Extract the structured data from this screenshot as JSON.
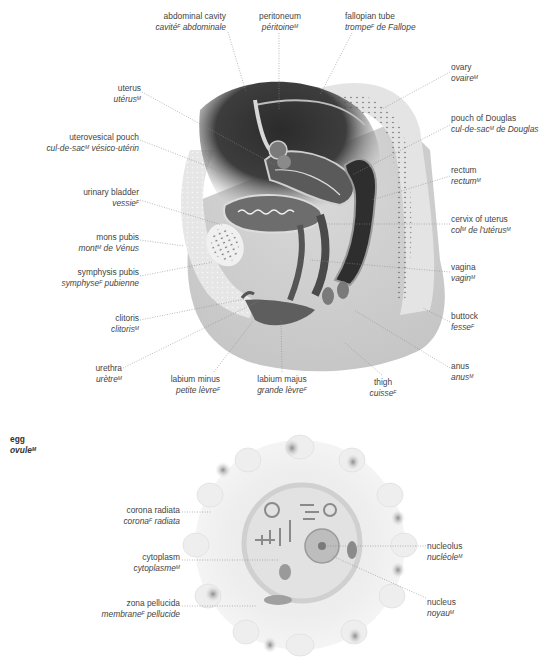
{
  "pelvis": {
    "labels": [
      {
        "id": "abdominal-cavity",
        "en": "abdominal cavity",
        "fr": "cavité",
        "fr_gender": "F",
        "fr_rest": " abdominale",
        "x": 226,
        "y": 11,
        "align": "r"
      },
      {
        "id": "peritoneum",
        "en": "peritoneum",
        "fr": "péritoine",
        "fr_gender": "M",
        "fr_rest": "",
        "x": 281,
        "y": 11,
        "align": "c"
      },
      {
        "id": "fallopian-tube",
        "en": "fallopian tube",
        "fr": "trompe",
        "fr_gender": "F",
        "fr_rest": " de Fallope",
        "x": 345,
        "y": 11,
        "align": "l"
      },
      {
        "id": "ovary",
        "en": "ovary",
        "fr": "ovaire",
        "fr_gender": "M",
        "fr_rest": "",
        "x": 451,
        "y": 62,
        "align": "l"
      },
      {
        "id": "uterus",
        "en": "uterus",
        "fr": "utérus",
        "fr_gender": "M",
        "fr_rest": "",
        "x": 141,
        "y": 83,
        "align": "r"
      },
      {
        "id": "uterovesical-pouch",
        "en": "uterovesical pouch",
        "fr": "cul-de-sac",
        "fr_gender": "M",
        "fr_rest": " vésico-utérin",
        "x": 139,
        "y": 132,
        "align": "r"
      },
      {
        "id": "pouch-of-douglas",
        "en": "pouch of Douglas",
        "fr": "cul-de-sac",
        "fr_gender": "M",
        "fr_rest": " de Douglas",
        "x": 451,
        "y": 113,
        "align": "l"
      },
      {
        "id": "rectum",
        "en": "rectum",
        "fr": "rectum",
        "fr_gender": "M",
        "fr_rest": "",
        "x": 451,
        "y": 165,
        "align": "l"
      },
      {
        "id": "urinary-bladder",
        "en": "urinary bladder",
        "fr": "vessie",
        "fr_gender": "F",
        "fr_rest": "",
        "x": 139,
        "y": 187,
        "align": "r"
      },
      {
        "id": "cervix-of-uterus",
        "en": "cervix of uterus",
        "fr": "col",
        "fr_gender": "M",
        "fr_rest": " de l'utérus",
        "fr_gender2": "M",
        "x": 451,
        "y": 214,
        "align": "l"
      },
      {
        "id": "mons-pubis",
        "en": "mons pubis",
        "fr": "mont",
        "fr_gender": "M",
        "fr_rest": " de Vénus",
        "x": 139,
        "y": 232,
        "align": "r"
      },
      {
        "id": "symphysis-pubis",
        "en": "symphysis pubis",
        "fr": "symphyse",
        "fr_gender": "F",
        "fr_rest": " pubienne",
        "x": 139,
        "y": 267,
        "align": "r"
      },
      {
        "id": "vagina",
        "en": "vagina",
        "fr": "vagin",
        "fr_gender": "M",
        "fr_rest": "",
        "x": 451,
        "y": 262,
        "align": "l"
      },
      {
        "id": "clitoris",
        "en": "clitoris",
        "fr": "clitoris",
        "fr_gender": "M",
        "fr_rest": "",
        "x": 139,
        "y": 313,
        "align": "r"
      },
      {
        "id": "buttock",
        "en": "buttock",
        "fr": "fesse",
        "fr_gender": "F",
        "fr_rest": "",
        "x": 451,
        "y": 311,
        "align": "l"
      },
      {
        "id": "anus",
        "en": "anus",
        "fr": "anus",
        "fr_gender": "M",
        "fr_rest": "",
        "x": 451,
        "y": 361,
        "align": "l"
      },
      {
        "id": "urethra",
        "en": "urethra",
        "fr": "urètre",
        "fr_gender": "M",
        "fr_rest": "",
        "x": 122,
        "y": 363,
        "align": "r"
      },
      {
        "id": "labium-minus",
        "en": "labium minus",
        "fr": "petite lèvre",
        "fr_gender": "F",
        "fr_rest": "",
        "x": 220,
        "y": 374,
        "align": "r"
      },
      {
        "id": "labium-majus",
        "en": "labium majus",
        "fr": "grande lèvre",
        "fr_gender": "F",
        "fr_rest": "",
        "x": 282,
        "y": 374,
        "align": "c"
      },
      {
        "id": "thigh",
        "en": "thigh",
        "fr": "cuisse",
        "fr_gender": "F",
        "fr_rest": "",
        "x": 383,
        "y": 377,
        "align": "c"
      }
    ]
  },
  "egg": {
    "title": {
      "en": "egg",
      "fr": "ovule",
      "fr_gender": "M"
    },
    "labels": [
      {
        "id": "corona-radiata",
        "en": "corona radiata",
        "fr": "corona",
        "fr_gender": "F",
        "fr_rest": " radiata",
        "x": 180,
        "y": 505,
        "align": "r"
      },
      {
        "id": "cytoplasm",
        "en": "cytoplasm",
        "fr": "cytoplasme",
        "fr_gender": "M",
        "fr_rest": "",
        "x": 180,
        "y": 552,
        "align": "r"
      },
      {
        "id": "zona-pellucida",
        "en": "zona pellucida",
        "fr": "membrane",
        "fr_gender": "F",
        "fr_rest": " pellucide",
        "x": 180,
        "y": 598,
        "align": "r"
      },
      {
        "id": "nucleolus",
        "en": "nucleolus",
        "fr": "nucléole",
        "fr_gender": "M",
        "fr_rest": "",
        "x": 427,
        "y": 541,
        "align": "l"
      },
      {
        "id": "nucleus",
        "en": "nucleus",
        "fr": "noyau",
        "fr_gender": "M",
        "fr_rest": "",
        "x": 427,
        "y": 597,
        "align": "l"
      }
    ]
  },
  "colors": {
    "background": "#ffffff",
    "text": "#444444",
    "leader": "#888888",
    "body_grey": "#d4d4d4",
    "cavity_dark": "#3a3a3a",
    "organ_mid": "#6e6e6e",
    "tissue_light": "#e6e6e6"
  }
}
